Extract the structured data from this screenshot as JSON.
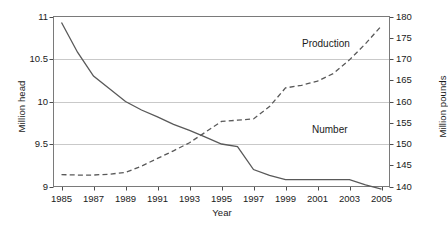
{
  "chart_data": {
    "type": "line",
    "title": "",
    "xlabel": "Year",
    "ylabel": "Million head",
    "ylabel_right": "Million pounds",
    "x": [
      1985,
      1986,
      1987,
      1988,
      1989,
      1990,
      1991,
      1992,
      1993,
      1994,
      1995,
      1996,
      1997,
      1998,
      1999,
      2000,
      2001,
      2002,
      2003,
      2004,
      2005
    ],
    "xlim": [
      1984.5,
      2005.5
    ],
    "xticks": [
      1985,
      1987,
      1989,
      1991,
      1993,
      1995,
      1997,
      1999,
      2001,
      2003,
      2005
    ],
    "xticklabels": [
      "1985",
      "1987",
      "1989",
      "1991",
      "1993",
      "1995",
      "1997",
      "1999",
      "2001",
      "2003",
      "2005"
    ],
    "ylim": [
      9,
      11
    ],
    "yticks": [
      9,
      9.5,
      10,
      10.5,
      11
    ],
    "yticklabels": [
      "9",
      "9.5",
      "10",
      "10.5",
      "11"
    ],
    "ylim_right": [
      140,
      180
    ],
    "yticks_right": [
      140,
      145,
      150,
      155,
      160,
      165,
      170,
      175,
      180
    ],
    "yticklabels_right": [
      "140",
      "145",
      "150",
      "155",
      "160",
      "165",
      "170",
      "175",
      "180"
    ],
    "grid": "horizontal",
    "legend_position": "inline-annotations",
    "series": [
      {
        "name": "Number",
        "axis": "left",
        "units": "Million head",
        "style": "solid",
        "color": "#595959",
        "label_text": "Number",
        "values": [
          10.93,
          10.58,
          10.3,
          10.15,
          10.0,
          9.9,
          9.82,
          9.73,
          9.66,
          9.58,
          9.5,
          9.47,
          9.2,
          9.13,
          9.08,
          9.08,
          9.08,
          9.08,
          9.08,
          9.02,
          8.97
        ]
      },
      {
        "name": "Production",
        "axis": "right",
        "units": "Million pounds",
        "style": "dashed",
        "color": "#595959",
        "label_text": "Production",
        "values": [
          142.8,
          142.7,
          142.7,
          142.9,
          143.3,
          144.8,
          146.6,
          148.4,
          150.3,
          152.8,
          155.3,
          155.6,
          155.9,
          158.8,
          163.2,
          163.8,
          164.8,
          166.6,
          169.8,
          173.6,
          177.8
        ]
      }
    ]
  },
  "annotations": {
    "production_label": "Production",
    "number_label": "Number"
  }
}
